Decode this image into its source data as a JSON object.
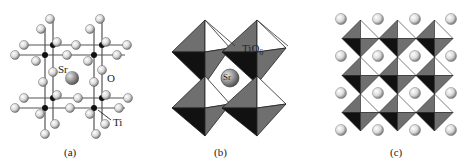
{
  "figure": {
    "panels": [
      {
        "id": "a",
        "caption": "(a)",
        "labels": {
          "sr": "Sr",
          "o": "O",
          "ti": "Ti"
        }
      },
      {
        "id": "b",
        "caption": "(b)",
        "labels": {
          "octahedron": "TiO",
          "octahedron_sub": "6",
          "sr": "Sr"
        }
      },
      {
        "id": "c",
        "caption": "(c)"
      }
    ]
  },
  "colors": {
    "sphere_light": "#f2f2f2",
    "sphere_dark": "#8a8a8a",
    "ti_atom": "#111111",
    "face_dark": "#111111",
    "face_mid": "#6f6f6f",
    "face_light": "#ffffff",
    "bond": "#555555"
  }
}
